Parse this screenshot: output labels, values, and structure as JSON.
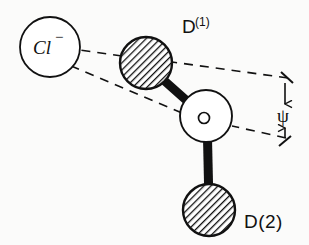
{
  "figure": {
    "background_color": "#fbfbfa",
    "ink_color": "#111111",
    "width": 309,
    "height": 245
  },
  "atoms": {
    "chloride": {
      "label": "Cl",
      "charge": "−",
      "style": "open-circle",
      "cx": 50,
      "cy": 47,
      "r": 30
    },
    "deuterium_1": {
      "label": "D",
      "superscript": "(1)",
      "style": "hatched-circle",
      "cx": 146,
      "cy": 63,
      "r": 26,
      "label_x": 182,
      "label_y": 33
    },
    "oxygen": {
      "label": "O",
      "inner_label": "O",
      "style": "open-circle",
      "cx": 206,
      "cy": 116,
      "r": 26
    },
    "deuterium_2": {
      "label": "D(2)",
      "style": "hatched-circle",
      "cx": 209,
      "cy": 210,
      "r": 26,
      "label_x": 244,
      "label_y": 228
    }
  },
  "bonds": [
    {
      "name": "bond-d1-o",
      "from": "deuterium_1",
      "to": "oxygen",
      "style": "solid-thick"
    },
    {
      "name": "bond-o-d2",
      "from": "oxygen",
      "to": "deuterium_2",
      "style": "solid-thick"
    }
  ],
  "guides": [
    {
      "name": "hydrogen-bond-axis",
      "style": "dashed",
      "note": "D(1) to chloride, arrowhead at chloride"
    },
    {
      "name": "reference-axis",
      "style": "dashed",
      "note": "O to chloride reference direction"
    }
  ],
  "angle": {
    "symbol": "ψ",
    "name": "psi",
    "symbol_x": 277,
    "symbol_y": 122,
    "dimension_line": "double-arrow-vertical"
  }
}
